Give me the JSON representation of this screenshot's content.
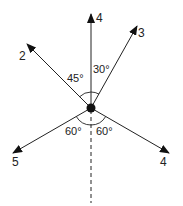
{
  "diagram": {
    "type": "force-vectors",
    "center": {
      "x": 91,
      "y": 108
    },
    "vectors": [
      {
        "label": "4",
        "direction": "up",
        "angle_from_vertical": 0
      },
      {
        "label": "3",
        "direction": "up-right",
        "angle_from_vertical": 30
      },
      {
        "label": "2",
        "direction": "up-left",
        "angle_from_vertical": 45
      },
      {
        "label": "5",
        "direction": "down-left",
        "angle_from_downward": 60
      },
      {
        "label": "4",
        "direction": "down-right",
        "angle_from_downward": 60
      }
    ],
    "angle_labels": {
      "upper_left": "45°",
      "upper_right": "30°",
      "lower_left": "60°",
      "lower_right": "60°"
    },
    "reference_line": "dashed vertical downward"
  }
}
